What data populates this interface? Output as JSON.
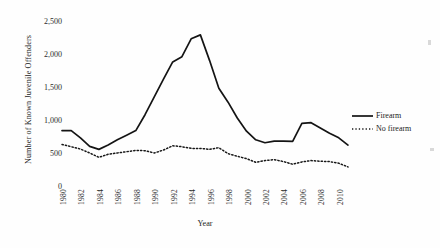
{
  "chart_data": {
    "type": "line",
    "title": "",
    "xlabel": "Year",
    "ylabel": "Number of Known Juvenile Offenders",
    "xlim": [
      1980,
      2011
    ],
    "ylim": [
      0,
      2500
    ],
    "ytick_labels": [
      "2,500",
      "2,000",
      "1,500",
      "1,000",
      "500",
      "0"
    ],
    "ytick_values": [
      2500,
      2000,
      1500,
      1000,
      500,
      0
    ],
    "xtick_labels": [
      "1980",
      "1982",
      "1984",
      "1986",
      "1988",
      "1990",
      "1992",
      "1994",
      "1996",
      "1998",
      "2000",
      "2002",
      "2004",
      "2006",
      "2008",
      "2010"
    ],
    "xtick_values": [
      1980,
      1982,
      1984,
      1986,
      1988,
      1990,
      1992,
      1994,
      1996,
      1998,
      2000,
      2002,
      2004,
      2006,
      2008,
      2010
    ],
    "grid": false,
    "legend_position": "right",
    "x": [
      1980,
      1981,
      1982,
      1983,
      1984,
      1985,
      1986,
      1987,
      1988,
      1989,
      1990,
      1991,
      1992,
      1993,
      1994,
      1995,
      1996,
      1997,
      1998,
      1999,
      2000,
      2001,
      2002,
      2003,
      2004,
      2005,
      2006,
      2007,
      2008,
      2009,
      2010,
      2011
    ],
    "series": [
      {
        "name": "Firearm",
        "style": "solid",
        "color": "#141414",
        "values": [
          840,
          840,
          730,
          600,
          555,
          620,
          700,
          770,
          840,
          1080,
          1350,
          1620,
          1880,
          1960,
          2230,
          2290,
          1900,
          1480,
          1270,
          1030,
          830,
          700,
          655,
          680,
          680,
          675,
          950,
          960,
          880,
          800,
          730,
          620
        ]
      },
      {
        "name": "No firearm",
        "style": "dotted",
        "color": "#171717",
        "values": [
          630,
          595,
          560,
          500,
          435,
          480,
          500,
          520,
          540,
          535,
          500,
          545,
          610,
          595,
          570,
          570,
          555,
          580,
          490,
          450,
          415,
          360,
          385,
          400,
          370,
          330,
          365,
          385,
          375,
          370,
          345,
          290
        ]
      }
    ]
  },
  "legend": {
    "items": [
      {
        "label": "Firearm",
        "style": "solid"
      },
      {
        "label": "No firearm",
        "style": "dotted"
      }
    ]
  }
}
